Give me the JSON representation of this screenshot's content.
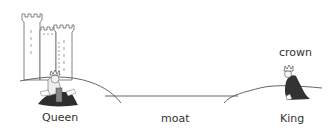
{
  "labels": {
    "queen": "Queen",
    "moat": "moat",
    "king": "King",
    "crown": "crown"
  },
  "colors": {
    "background": "#ffffff",
    "line": "#555555",
    "text": "#333333",
    "robe": "#3a3a3a"
  }
}
